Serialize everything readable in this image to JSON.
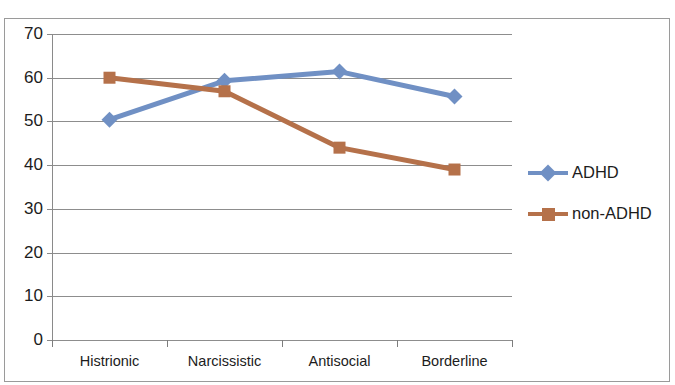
{
  "chart_data": {
    "type": "line",
    "title": "",
    "xlabel": "",
    "ylabel": "",
    "categories": [
      "Histrionic",
      "Narcissistic",
      "Antisocial",
      "Borderline"
    ],
    "series": [
      {
        "name": "ADHD",
        "values": [
          50.4,
          59.3,
          61.4,
          55.7
        ],
        "color": "#7090c4",
        "marker": "diamond"
      },
      {
        "name": "non-ADHD",
        "values": [
          60.0,
          56.9,
          44.0,
          39.0
        ],
        "color": "#b5714a",
        "marker": "square"
      }
    ],
    "ylim": [
      0,
      70
    ],
    "ytick_labels": [
      "70",
      "60",
      "50",
      "40",
      "30",
      "20",
      "10",
      "0"
    ],
    "ytick_values": [
      70,
      60,
      50,
      40,
      30,
      20,
      10,
      0
    ],
    "grid": "horizontal",
    "legend_position": "right"
  },
  "legend": {
    "entries": [
      {
        "label": "ADHD"
      },
      {
        "label": "non-ADHD"
      }
    ]
  },
  "colors": {
    "series_adhd": "#7090c4",
    "series_non_adhd": "#b5714a",
    "gridline": "#8d8d8d",
    "axis": "#8a8a8a",
    "border": "#9a9a9a",
    "text": "#1c1c1c"
  }
}
